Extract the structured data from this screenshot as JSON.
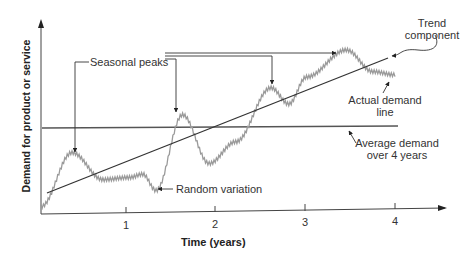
{
  "chart_data": {
    "type": "line",
    "title": "",
    "xlabel": "Time (years)",
    "ylabel": "Demand for product or service",
    "x_ticks": [
      "1",
      "2",
      "3",
      "4"
    ],
    "xlim": [
      0,
      4.5
    ],
    "grid": false,
    "series": [
      {
        "name": "Actual demand line",
        "style": "gray zigzag",
        "points": [
          [
            0.0,
            0.05
          ],
          [
            0.35,
            0.55
          ],
          [
            0.7,
            0.3
          ],
          [
            1.0,
            0.32
          ],
          [
            1.15,
            0.35
          ],
          [
            1.3,
            0.2
          ],
          [
            1.6,
            0.9
          ],
          [
            1.9,
            0.45
          ],
          [
            2.2,
            0.65
          ],
          [
            2.6,
            1.15
          ],
          [
            2.8,
            1.0
          ],
          [
            3.0,
            1.25
          ],
          [
            3.45,
            1.5
          ],
          [
            3.75,
            1.3
          ],
          [
            4.0,
            1.27
          ]
        ]
      },
      {
        "name": "Trend component",
        "style": "straight dark line",
        "points": [
          [
            0.05,
            0.2
          ],
          [
            3.9,
            1.45
          ]
        ]
      },
      {
        "name": "Average demand over 4 years",
        "style": "horizontal line",
        "points": [
          [
            0.0,
            0.82
          ],
          [
            4.0,
            0.82
          ]
        ]
      }
    ],
    "annotations": [
      {
        "text": "Seasonal peaks",
        "targets": [
          [
            0.35,
            0.55
          ],
          [
            1.6,
            0.9
          ],
          [
            2.6,
            1.15
          ],
          [
            3.45,
            1.5
          ]
        ]
      },
      {
        "text": "Random variation",
        "target": [
          1.3,
          0.2
        ]
      },
      {
        "text": "Trend component",
        "target": [
          3.9,
          1.45
        ]
      },
      {
        "text": "Actual demand line",
        "target": [
          3.75,
          1.3
        ]
      },
      {
        "text": "Average demand over 4 years",
        "target": [
          3.5,
          0.82
        ]
      }
    ]
  },
  "labels": {
    "seasonal_peaks": "Seasonal peaks",
    "trend_line1": "Trend",
    "trend_line2": "component",
    "actual_line1": "Actual demand",
    "actual_line2": "line",
    "average_line1": "Average demand",
    "average_line2": "over 4 years",
    "random_variation": "Random variation"
  },
  "axes": {
    "ylabel": "Demand for product or service",
    "xlabel": "Time (years)",
    "ticks": [
      "1",
      "2",
      "3",
      "4"
    ]
  }
}
